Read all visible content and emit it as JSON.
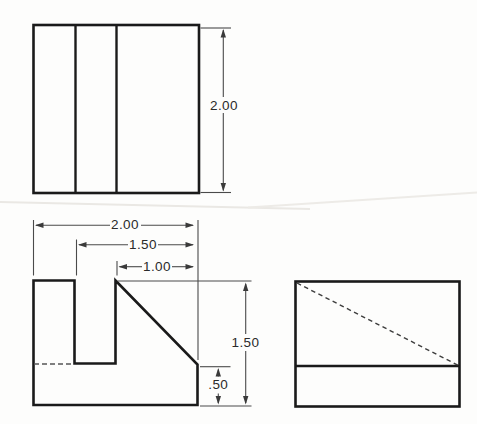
{
  "drawing": {
    "colors": {
      "background": "#fdfdfc",
      "outline": "#1a1a1a",
      "dimension_line": "#4a4a4a",
      "arrowhead": "#3a3a3a",
      "dimension_text": "#2a2a2a",
      "hidden_line": "#555555",
      "crease": "#eae8e4"
    },
    "top_view": {
      "height_dim": "2.00"
    },
    "front_view": {
      "width_dim": "2.00",
      "step_width_dim": "1.50",
      "slope_width_dim": "1.00",
      "height_dim": "1.50",
      "base_height_dim": ".50"
    }
  }
}
